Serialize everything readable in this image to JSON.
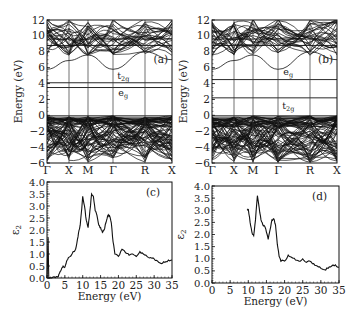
{
  "chart_data": [
    {
      "panel": "(a)",
      "type": "line",
      "title": "",
      "xlabel": "",
      "ylabel": "Energy (eV)",
      "ylim": [
        -6,
        12
      ],
      "yticks": [
        "12",
        "10",
        "8",
        "6",
        "4",
        "2",
        "0",
        "-2",
        "-4",
        "-6"
      ],
      "k_path": [
        "Γ",
        "X",
        "M",
        "Γ",
        "R",
        "X"
      ],
      "annotations": [
        {
          "text": "t2g",
          "energy": 5.0,
          "note": "label above flat band"
        },
        {
          "text": "eg",
          "energy": 2.8,
          "note": "label below flat band"
        },
        {
          "text": "(a)",
          "position": "upper-right"
        }
      ],
      "flat_bands": [
        {
          "label": "t2g",
          "energy": 4.1
        },
        {
          "label": "eg",
          "energy": 3.5
        }
      ],
      "valence_band_top": 0,
      "conduction_band_min": {
        "k": "Γ",
        "energy": 5.8
      },
      "grid": false,
      "series": [
        {
          "name": "bands",
          "description": "dense band structure from -6 to 0 eV and 6 to 12 eV"
        }
      ]
    },
    {
      "panel": "(b)",
      "type": "line",
      "xlabel": "",
      "ylabel": "Energy (eV)",
      "ylim": [
        -6,
        12
      ],
      "yticks": [
        "12",
        "10",
        "8",
        "6",
        "4",
        "2",
        "0",
        "-2",
        "-4",
        "-6"
      ],
      "k_path": [
        "Γ",
        "X",
        "M",
        "Γ",
        "R",
        "X"
      ],
      "annotations": [
        {
          "text": "eg",
          "energy": 5.5
        },
        {
          "text": "t2g",
          "energy": 1.2
        },
        {
          "text": "(b)",
          "position": "upper-right"
        }
      ],
      "flat_bands": [
        {
          "label": "eg",
          "energy": 4.5
        },
        {
          "label": "t2g",
          "energy": 2.2
        }
      ],
      "valence_band_top": 0,
      "conduction_band_min": {
        "k": "Γ",
        "energy": 5.8
      },
      "grid": false,
      "series": [
        {
          "name": "bands",
          "description": "dense band structure from -6 to 0 eV and 6 to 12 eV"
        }
      ]
    },
    {
      "panel": "(c)",
      "type": "line",
      "xlabel": "Energy (eV)",
      "ylabel": "ε2",
      "xlim": [
        0,
        35
      ],
      "ylim": [
        0,
        4.0
      ],
      "xticks": [
        "0",
        "5",
        "10",
        "15",
        "20",
        "25",
        "30",
        "35"
      ],
      "yticks": [
        "4.0",
        "3.5",
        "3.0",
        "2.5",
        "2.0",
        "1.5",
        "1.0",
        "0.5",
        "0.0"
      ],
      "annotations": [
        {
          "text": "(c)",
          "position": "upper-right"
        }
      ],
      "x": [
        0,
        0.3,
        0.5,
        1,
        2,
        3,
        3.5,
        4,
        4.5,
        5,
        5.5,
        6,
        7,
        8,
        8.5,
        9,
        9.3,
        9.6,
        10,
        10.5,
        11,
        11.5,
        12,
        12.5,
        13,
        13.5,
        14,
        14.5,
        15,
        15.5,
        16,
        16.5,
        17,
        17.5,
        18,
        18.5,
        19,
        20,
        21,
        22,
        23,
        24,
        25,
        26,
        27,
        28,
        29,
        30,
        31,
        32,
        33,
        34,
        35
      ],
      "values": [
        0,
        1.7,
        0,
        0,
        0.05,
        0.05,
        0.2,
        0.35,
        0.5,
        0.45,
        0.7,
        0.85,
        1.0,
        1.2,
        1.6,
        2.0,
        2.2,
        2.7,
        3.4,
        3.0,
        2.4,
        2.1,
        2.8,
        3.5,
        3.4,
        2.8,
        2.6,
        2.2,
        2.1,
        1.9,
        2.0,
        2.3,
        2.6,
        2.6,
        2.3,
        1.5,
        1.0,
        0.9,
        1.2,
        1.05,
        0.95,
        1.0,
        0.9,
        1.1,
        1.0,
        0.9,
        0.85,
        0.8,
        0.7,
        0.6,
        0.65,
        0.75,
        0.75
      ]
    },
    {
      "panel": "(d)",
      "type": "line",
      "xlabel": "Energy (eV)",
      "ylabel": "ε2",
      "xlim": [
        0,
        35
      ],
      "ylim": [
        0,
        4.0
      ],
      "xticks": [
        "0",
        "5",
        "10",
        "15",
        "20",
        "25",
        "30",
        "35"
      ],
      "yticks": [
        "4.0",
        "3.5",
        "3.0",
        "2.5",
        "2.0",
        "1.5",
        "1.0",
        "0.5",
        "0.0"
      ],
      "annotations": [
        {
          "text": "(d)",
          "position": "upper-right"
        }
      ],
      "x": [
        9.7,
        10,
        10.5,
        11,
        11.5,
        12,
        12.5,
        13,
        13.5,
        14,
        14.5,
        15,
        15.5,
        16,
        16.5,
        17,
        17.5,
        18,
        18.5,
        19,
        20,
        21,
        22,
        23,
        24,
        25,
        26,
        27,
        28,
        29,
        30,
        31,
        32,
        33,
        34,
        35
      ],
      "values": [
        3.0,
        3.05,
        2.5,
        2.1,
        1.95,
        2.6,
        3.6,
        3.1,
        2.6,
        2.4,
        2.35,
        2.1,
        1.8,
        2.2,
        2.6,
        2.65,
        2.4,
        1.6,
        1.1,
        0.9,
        0.9,
        1.15,
        1.05,
        0.95,
        0.9,
        1.0,
        0.85,
        0.9,
        0.8,
        0.7,
        0.6,
        0.55,
        0.6,
        0.7,
        0.75,
        0.65
      ]
    }
  ],
  "panels": {
    "a": {
      "label": "(a)",
      "ylabel": "Energy (eV)",
      "upper_label": "t",
      "upper_sub": "2g",
      "lower_label": "e",
      "lower_sub": "g"
    },
    "b": {
      "label": "(b)",
      "ylabel": "Energy (eV)",
      "upper_label": "e",
      "upper_sub": "g",
      "lower_label": "t",
      "lower_sub": "2g"
    },
    "c": {
      "label": "(c)",
      "ylabel": "ε",
      "ylabel_sub": "2",
      "xlabel": "Energy (eV)"
    },
    "d": {
      "label": "(d)",
      "ylabel": "ε",
      "ylabel_sub": "2",
      "xlabel": "Energy (eV)"
    }
  }
}
